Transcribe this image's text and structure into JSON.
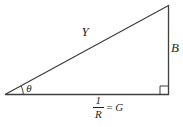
{
  "diagram": {
    "labels": {
      "hypotenuse": "Y",
      "vertical_side": "B",
      "angle": "θ",
      "base": {
        "numerator": "1",
        "denominator": "R",
        "equals": "=",
        "rhs": "G"
      }
    },
    "colors": {
      "line": "#3f3f3f",
      "text": "#1f1f1f",
      "background": "#ffffff"
    }
  }
}
